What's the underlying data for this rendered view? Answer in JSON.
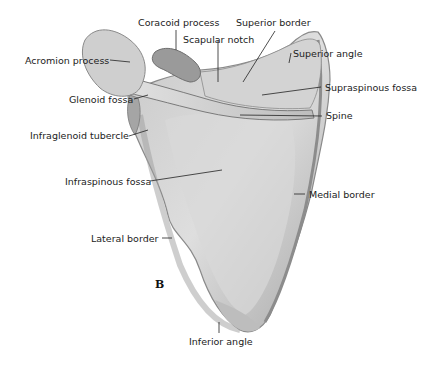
{
  "figure": {
    "panel_letter": "B"
  },
  "labels": {
    "coracoid_process": "Coracoid process",
    "superior_border": "Superior border",
    "scapular_notch": "Scapular notch",
    "superior_angle": "Superior angle",
    "acromion_process": "Acromion process",
    "supraspinous_fossa": "Supraspinous fossa",
    "glenoid_fossa": "Glenoid fossa",
    "spine": "Spine",
    "infraglenoid_tubercle": "Infraglenoid tubercle",
    "infraspinous_fossa": "Infraspinous fossa",
    "medial_border": "Medial border",
    "lateral_border": "Lateral border",
    "inferior_angle": "Inferior angle"
  },
  "colors": {
    "bone_light": "#d6d6d6",
    "bone_mid": "#b4b4b4",
    "bone_dark": "#7a7a7a",
    "leader_line": "#222222"
  }
}
